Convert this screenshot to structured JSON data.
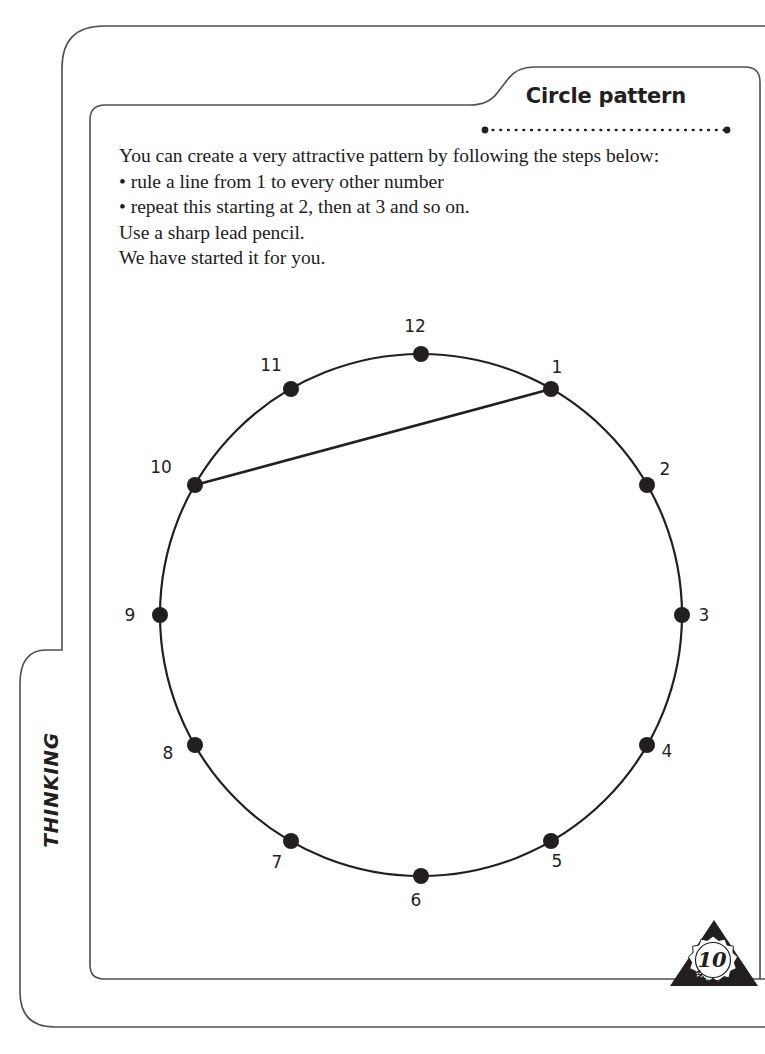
{
  "page": {
    "header": {
      "title": "Circle pattern",
      "rule_style": "dotted"
    },
    "strand_label": "THINKING",
    "instructions": {
      "intro": "You can create a very attractive pattern by following the steps below:",
      "bullets": [
        "• rule a line from 1 to every other number",
        "• repeat this starting at 2, then at 3 and so on."
      ],
      "note_1": "Use a sharp lead pencil.",
      "note_2": "We have started it for you."
    },
    "timer_badge": {
      "number": "10",
      "unit": "MINUTES"
    },
    "colors": {
      "ink": "#231f20",
      "border": "#4a4a4a",
      "paper": "#ffffff"
    }
  },
  "chart_data": {
    "type": "scatter",
    "title": "Circle pattern",
    "xlabel": "",
    "ylabel": "",
    "grid": false,
    "legend": "none",
    "circle": {
      "cx": 421,
      "cy": 615,
      "r": 261
    },
    "categories": [
      "1",
      "2",
      "3",
      "4",
      "5",
      "6",
      "7",
      "8",
      "9",
      "10",
      "11",
      "12"
    ],
    "points": [
      {
        "label": "1",
        "angle_deg": 60,
        "x": 551,
        "y": 389,
        "label_dx": 6,
        "label_dy": -16
      },
      {
        "label": "2",
        "angle_deg": 30,
        "x": 647,
        "y": 485,
        "label_dx": 18,
        "label_dy": -10
      },
      {
        "label": "3",
        "angle_deg": 0,
        "x": 682,
        "y": 615,
        "label_dx": 22,
        "label_dy": 6
      },
      {
        "label": "4",
        "angle_deg": -30,
        "x": 647,
        "y": 745,
        "label_dx": 20,
        "label_dy": 12
      },
      {
        "label": "5",
        "angle_deg": -60,
        "x": 551,
        "y": 841,
        "label_dx": 6,
        "label_dy": 26
      },
      {
        "label": "6",
        "angle_deg": -90,
        "x": 421,
        "y": 876,
        "label_dx": -5,
        "label_dy": 30
      },
      {
        "label": "7",
        "angle_deg": -120,
        "x": 291,
        "y": 841,
        "label_dx": -14,
        "label_dy": 27
      },
      {
        "label": "8",
        "angle_deg": -150,
        "x": 195,
        "y": 745,
        "label_dx": -27,
        "label_dy": 14
      },
      {
        "label": "9",
        "angle_deg": 180,
        "x": 160,
        "y": 615,
        "label_dx": -30,
        "label_dy": 6
      },
      {
        "label": "10",
        "angle_deg": 150,
        "x": 195,
        "y": 485,
        "label_dx": -34,
        "label_dy": -12
      },
      {
        "label": "11",
        "angle_deg": 120,
        "x": 291,
        "y": 389,
        "label_dx": -20,
        "label_dy": -18
      },
      {
        "label": "12",
        "angle_deg": 90,
        "x": 421,
        "y": 354,
        "label_dx": -6,
        "label_dy": -22
      }
    ],
    "chords_drawn": [
      {
        "from": "10",
        "to": "1"
      }
    ],
    "dot_radius": 8
  }
}
